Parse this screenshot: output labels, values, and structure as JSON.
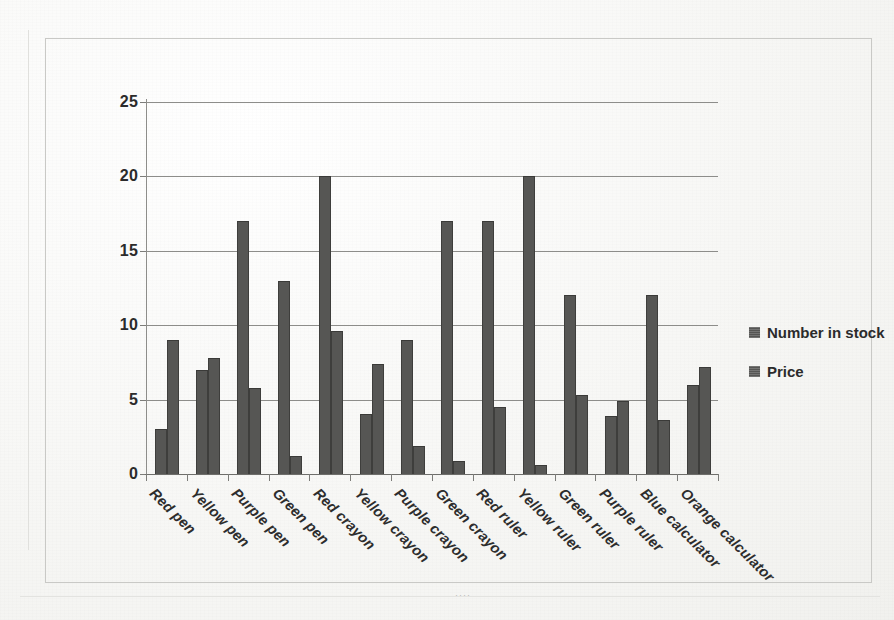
{
  "chart_data": {
    "type": "bar",
    "title": "",
    "subtitle": "",
    "xlabel": "",
    "ylabel": "",
    "ylim": [
      0,
      25
    ],
    "ytick_values": [
      0,
      5,
      10,
      15,
      20,
      25
    ],
    "ytick_labels": [
      "0",
      "5",
      "10",
      "15",
      "20",
      "25"
    ],
    "grid": true,
    "grid_axis": "y",
    "legend_position": "right",
    "bar_style": "grouped",
    "categories": [
      "Red pen",
      "Yellow pen",
      "Purple pen",
      "Green pen",
      "Red crayon",
      "Yellow crayon",
      "Purple crayon",
      "Green crayon",
      "Red ruler",
      "Yellow ruler",
      "Green ruler",
      "Purple ruler",
      "Blue calculator",
      "Orange calculator"
    ],
    "series": [
      {
        "name": "Number in stock",
        "color": "#565654",
        "values": [
          3,
          7,
          17,
          13,
          20,
          4,
          9,
          17,
          17,
          20,
          12,
          3.9,
          12,
          6
        ]
      },
      {
        "name": "Price",
        "color": "#565654",
        "values": [
          9,
          7.8,
          5.8,
          1.2,
          9.6,
          7.4,
          1.9,
          0.9,
          4.5,
          0.6,
          5.3,
          4.9,
          3.6,
          7.2
        ]
      }
    ]
  },
  "legend": {
    "items": [
      {
        "label": "Number in stock",
        "swatch_name": "legend-swatch-number-in-stock"
      },
      {
        "label": "Price",
        "swatch_name": "legend-swatch-price"
      }
    ]
  },
  "artifacts": {
    "scan_dots": "····"
  }
}
